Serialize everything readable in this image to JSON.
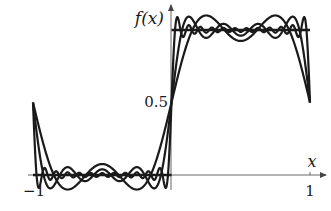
{
  "chart_data": {
    "type": "line",
    "title": "",
    "xlabel": "x",
    "ylabel": "f(x)",
    "xlim": [
      -1,
      1
    ],
    "ylim": [
      0,
      1
    ],
    "x_ticks": [
      {
        "value": -1,
        "label": "−1"
      },
      {
        "value": 1,
        "label": "1"
      }
    ],
    "y_ticks": [
      {
        "value": 0.5,
        "label": "0.5"
      }
    ],
    "grid": false,
    "legend": "none",
    "series": [
      {
        "name": "step function",
        "kind": "step",
        "segments": [
          {
            "x": [
              -1,
              0
            ],
            "y": [
              0,
              0
            ]
          },
          {
            "x": [
              0,
              1
            ],
            "y": [
              1,
              1
            ]
          }
        ]
      },
      {
        "name": "Fourier partial sum (2 odd terms)",
        "kind": "fourier",
        "odd_terms": 2
      },
      {
        "name": "Fourier partial sum (4 odd terms)",
        "kind": "fourier",
        "odd_terms": 4
      },
      {
        "name": "Fourier partial sum (12 odd terms)",
        "kind": "fourier",
        "odd_terms": 12
      }
    ],
    "colors": {
      "ink": "#1a1a1a",
      "axis": "#555555"
    }
  }
}
